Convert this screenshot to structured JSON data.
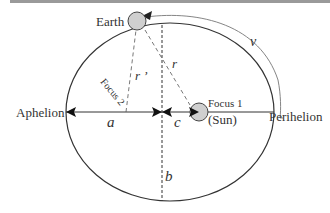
{
  "diagram": {
    "labels": {
      "earth": "Earth",
      "aphelion": "Aphelion",
      "perihelion": "Perihelion",
      "focus1": "Focus 1",
      "sun": "(Sun)",
      "focus2": "Focus 2",
      "r": "r",
      "r_prime": "r ’",
      "v": "v",
      "a": "a",
      "b": "b",
      "c": "c"
    },
    "colors": {
      "line": "#333333",
      "body_fill": "#cfcfcf",
      "top_bar": "#9a9a9a",
      "velocity_arc": "#888888"
    }
  }
}
